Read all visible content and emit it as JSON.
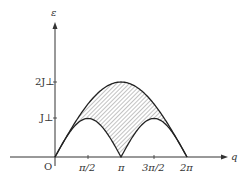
{
  "diagram": {
    "y_axis_label": "ε",
    "x_axis_label": "q",
    "origin_label": "O",
    "y_ticks": [
      {
        "label": "2J⊥",
        "value": 2
      },
      {
        "label": "J⊥",
        "value": 1
      }
    ],
    "x_ticks": [
      {
        "label": "π/2",
        "value": 0.5
      },
      {
        "label": "π",
        "value": 1
      },
      {
        "label": "3π/2",
        "value": 1.5
      },
      {
        "label": "2π",
        "value": 2
      }
    ],
    "curves": [
      {
        "name": "upper-boundary",
        "formula": "2J⊥ sin(q/2)",
        "peak": "2J⊥ at q=π"
      },
      {
        "name": "lower-boundary",
        "formula": "J⊥ |sin q|",
        "peaks": "J⊥ at q=π/2, 3π/2"
      }
    ],
    "shaded_region": "continuum between lower and upper boundary (hatched)",
    "colors": {
      "line": "#222222",
      "hatch": "#555555",
      "background": "#ffffff"
    }
  }
}
